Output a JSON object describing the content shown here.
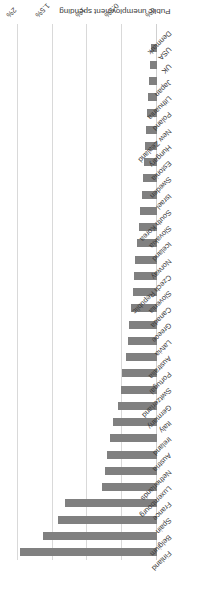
{
  "chart_data": {
    "type": "bar",
    "orientation": "horizontal",
    "title": "",
    "subtitle": "",
    "xlabel": "",
    "ylabel": "Public unemployment spending",
    "axis_title": "Public unemployment spending",
    "xlim": [
      0,
      2
    ],
    "tick_labels": [
      "0%",
      "0.5%",
      "1%",
      "1.5%",
      "2%"
    ],
    "tick_values": [
      0,
      0.5,
      1,
      1.5,
      2
    ],
    "grid": true,
    "legend": "none",
    "bar_color": "#808080",
    "gridline_color": "#d9d9d9",
    "text_color": "#3b3b3b",
    "units": "percent of GDP",
    "categories": [
      "Finland",
      "Belgium",
      "Spain",
      "France",
      "Luxembourg",
      "Netherlands",
      "Austria",
      "Ireland",
      "Italy",
      "Germany",
      "Switzerland",
      "Portugal",
      "Australia",
      "Latvia",
      "Greece",
      "Canada",
      "Slovenia",
      "Czech Republic",
      "Norway",
      "Iceland",
      "Slovakia",
      "South Korea",
      "Israel",
      "Sweden",
      "Estonia",
      "Hungary",
      "New Zealand",
      "Poland",
      "Lithuania",
      "Japan",
      "UK",
      "USA",
      "Denmark"
    ],
    "values": [
      1.97,
      1.64,
      1.42,
      1.32,
      0.79,
      0.75,
      0.72,
      0.67,
      0.64,
      0.56,
      0.52,
      0.5,
      0.45,
      0.42,
      0.4,
      0.38,
      0.35,
      0.33,
      0.31,
      0.29,
      0.26,
      0.24,
      0.22,
      0.2,
      0.18,
      0.17,
      0.16,
      0.15,
      0.13,
      0.12,
      0.1,
      0.08,
      0.0
    ]
  }
}
